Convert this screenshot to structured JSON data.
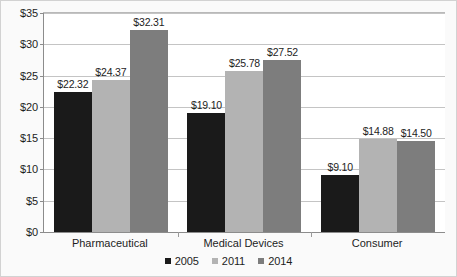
{
  "chart_data": {
    "type": "bar",
    "title": "",
    "subtitle": "",
    "xlabel": "",
    "ylabel": "",
    "categories": [
      "Pharmaceutical",
      "Medical Devices",
      "Consumer"
    ],
    "series": [
      {
        "name": "2005",
        "color": "#1a1a1a",
        "values": [
          22.32,
          19.1,
          9.1
        ],
        "labels": [
          "$22.32",
          "$19.10",
          "$9.10"
        ]
      },
      {
        "name": "2011",
        "color": "#b3b3b3",
        "values": [
          24.37,
          25.78,
          14.88
        ],
        "labels": [
          "$24.37",
          "$25.78",
          "$14.88"
        ]
      },
      {
        "name": "2014",
        "color": "#7d7d7d",
        "values": [
          32.31,
          27.52,
          14.5
        ],
        "labels": [
          "$32.31",
          "$27.52",
          "$14.50"
        ]
      }
    ],
    "ylim": [
      0,
      35
    ],
    "ytick_values": [
      0,
      5,
      10,
      15,
      20,
      25,
      30,
      35
    ],
    "ytick_labels": [
      "$0",
      "$5",
      "$10",
      "$15",
      "$20",
      "$25",
      "$30",
      "$35"
    ],
    "grid": true,
    "legend_position": "bottom",
    "legend_entries": [
      "2005",
      "2011",
      "2014"
    ]
  }
}
